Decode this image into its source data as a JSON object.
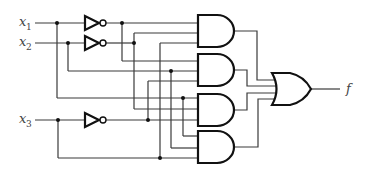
{
  "diagram": {
    "type": "logic-circuit",
    "inputs": [
      {
        "name": "x",
        "subscript": "1",
        "y": 23
      },
      {
        "name": "x",
        "subscript": "2",
        "y": 43
      },
      {
        "name": "x",
        "subscript": "3",
        "y": 120
      }
    ],
    "output": {
      "name": "f"
    },
    "gates": [
      {
        "id": "not1",
        "type": "NOT",
        "input": "x1"
      },
      {
        "id": "not2",
        "type": "NOT",
        "input": "x2"
      },
      {
        "id": "not3",
        "type": "NOT",
        "input": "x3"
      },
      {
        "id": "and1",
        "type": "AND",
        "inputs": 3
      },
      {
        "id": "and2",
        "type": "AND",
        "inputs": 3
      },
      {
        "id": "and3",
        "type": "AND",
        "inputs": 3
      },
      {
        "id": "and4",
        "type": "AND",
        "inputs": 3
      },
      {
        "id": "or1",
        "type": "OR",
        "inputs": 4
      }
    ],
    "colors": {
      "wire": "#3a3a3a",
      "gate": "#111111",
      "label": "#444444"
    }
  }
}
